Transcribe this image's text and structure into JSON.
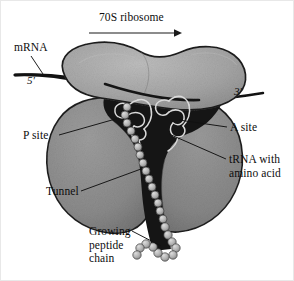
{
  "figure": {
    "title": "70S ribosome",
    "background_color": "#ffffff",
    "ink_color": "#0d0d0d"
  },
  "labels": {
    "ribosome": "70S ribosome",
    "mrna": "mRNA",
    "five_prime": "5′",
    "three_prime": "3′",
    "p_site": "P site",
    "a_site": "A site",
    "trna_line1": "tRNA with",
    "trna_line2": "amino acid",
    "tunnel": "Tunnel",
    "growing_line1": "Growing",
    "growing_line2": "peptide",
    "growing_line3": "chain"
  },
  "structures": {
    "small_subunit": {
      "name": "30S small subunit",
      "fill": "#a5a5a5",
      "stroke": "#1c1c1c"
    },
    "large_subunit": {
      "name": "50S large subunit",
      "fill": "#8a8a8a",
      "stroke": "#1c1c1c"
    },
    "cavity": {
      "name": "peptidyl transferase cavity",
      "fill": "#141414"
    },
    "mrna_strand": {
      "name": "mRNA strand",
      "stroke": "#121212"
    },
    "trna_molecules": {
      "count": 2,
      "sites": [
        "P site",
        "A site"
      ],
      "stroke": "#d8d8d8"
    },
    "peptide_chain": {
      "name": "growing polypeptide chain",
      "bead_fill": "#b9b9b9",
      "bead_stroke": "#3a3a3a",
      "bead_count": 26
    },
    "direction_arrow": {
      "name": "translation direction",
      "points": "right"
    }
  }
}
